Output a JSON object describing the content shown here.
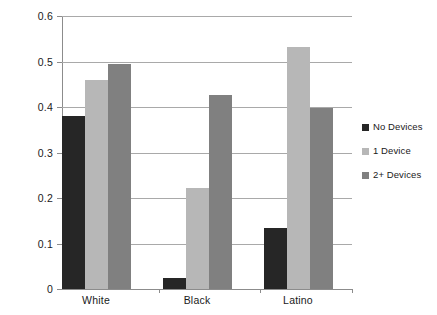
{
  "chart_data": {
    "type": "bar",
    "title": "",
    "subtitle": "",
    "xlabel": "",
    "ylabel": "",
    "categories": [
      "White",
      "Black",
      "Latino"
    ],
    "series": [
      {
        "name": "No Devices",
        "color": "#262626",
        "values": [
          0.38,
          0.024,
          0.134
        ]
      },
      {
        "name": "1 Device",
        "color": "#b7b7b7",
        "values": [
          0.46,
          0.222,
          0.532
        ]
      },
      {
        "name": "2+ Devices",
        "color": "#808080",
        "values": [
          0.495,
          0.426,
          0.397
        ]
      }
    ],
    "ylim": [
      0,
      0.6
    ],
    "ytick_labels": [
      "0.6",
      "0.5",
      "0.4",
      "0.3",
      "0.2",
      "0.1",
      "0"
    ],
    "ytick_values": [
      0.6,
      0.5,
      0.4,
      0.3,
      0.2,
      0.1,
      0
    ],
    "grid": "horizontal",
    "legend_position": "right",
    "background_color": "#ffffff",
    "gridline_color": "#a9a9a9",
    "axis_color": "#8c8c8c",
    "text_color": "#1a1a1a"
  }
}
